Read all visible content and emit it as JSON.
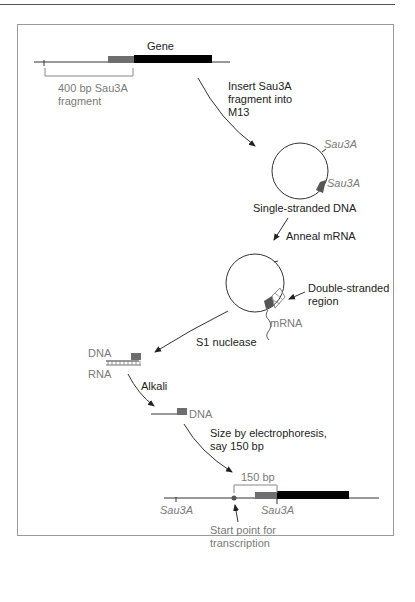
{
  "diagram": {
    "labels": {
      "gene": "Gene",
      "fragment_line1": "400 bp Sau3A",
      "fragment_line2": "fragment",
      "insert_line1": "Insert Sau3A",
      "insert_line2": "fragment into",
      "insert_line3": "M13",
      "sau3a_top": "Sau3A",
      "sau3a_bottom": "Sau3A",
      "single_stranded": "Single-stranded DNA",
      "anneal": "Anneal mRNA",
      "double_stranded_line1": "Double-stranded",
      "double_stranded_line2": "region",
      "mrna": "mRNA",
      "s1": "S1 nuclease",
      "dna1": "DNA",
      "rna": "RNA",
      "alkali": "Alkali",
      "dna2": "DNA",
      "size_line1": "Size by electrophoresis,",
      "size_line2": "say 150 bp",
      "bp150": "150 bp",
      "sau3a_left": "Sau3A",
      "sau3a_right": "Sau3A",
      "start_line1": "Start point for",
      "start_line2": "transcription"
    },
    "colors": {
      "gene_black": "#000000",
      "fragment_gray": "#6e6e6e",
      "label_gray": "#7a7a7a",
      "line": "#333333"
    }
  }
}
